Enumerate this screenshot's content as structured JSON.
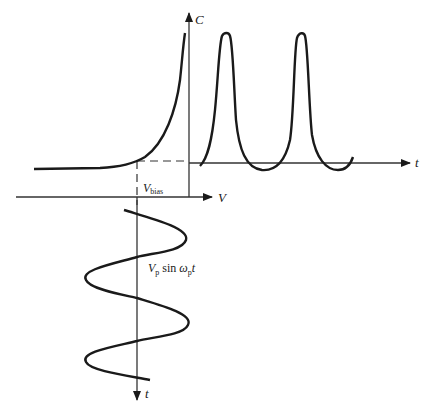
{
  "diagram": {
    "colors": {
      "ink": "#1a1a1a",
      "axis": "#333333",
      "background": "#ffffff"
    },
    "axes": {
      "capacitance": {
        "label": "C"
      },
      "voltage": {
        "label": "V"
      },
      "time_right": {
        "label": "t"
      },
      "time_down": {
        "label": "t"
      }
    },
    "labels": {
      "bias": {
        "main": "V",
        "sub": "bias"
      },
      "pump": {
        "v": "V",
        "v_sub": "p",
        "sin": " sin ",
        "omega": "ω",
        "omega_sub": "p",
        "t": "t"
      }
    },
    "curves": [
      {
        "name": "C-V characteristic",
        "shape": "flat then exponential rise near V=0"
      },
      {
        "name": "C(t) pumped capacitance",
        "shape": "periodic sharp peaks",
        "peaks": 2
      },
      {
        "name": "V(t) pump voltage",
        "shape": "sinusoid about V_bias, vertical time axis",
        "cycles": 2
      }
    ]
  }
}
